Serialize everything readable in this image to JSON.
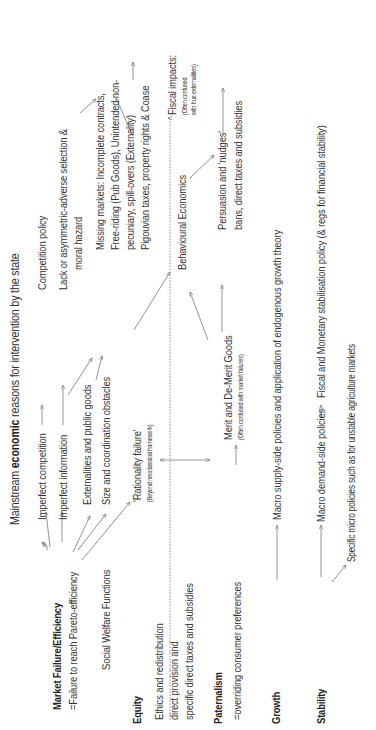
{
  "title": {
    "prefix": "Mainstream ",
    "bold": "economic",
    "suffix": " reasons for intervention by the state"
  },
  "categories": {
    "market_failure": {
      "label": "Market Failure/Efficiency",
      "subtitle": "=Failure to reach Pareto-efficiency"
    },
    "social_welfare": "Social Welfare Functions",
    "equity": {
      "label": "Equity",
      "lines": [
        "Ethics and redistribution",
        "direct provision and",
        "specific direct taxes and subsidies"
      ]
    },
    "paternalism": {
      "label": "Paternalism",
      "subtitle": "=overriding consumer preferences"
    },
    "growth": {
      "label": "Growth",
      "policy": "Macro supply-side policies and application of endogenous growth theory"
    },
    "stability": {
      "label": "Stability",
      "policy_demand": "Macro demand-side policies",
      "policy_fiscal": "Fiscal and Monetary stabilisation policy (& regs for financial stability)",
      "policy_micro": "Specific micro policies such as for unstable agriculture markets"
    }
  },
  "market_failures": [
    "Imperfect competition",
    "Imperfect information",
    "Externalities and public goods",
    "Size and coordination obstacles"
  ],
  "rationality": {
    "label": "'Rationality failure'",
    "note": "(Beyond neoclassical framework)"
  },
  "merit": {
    "label": "Merit and De-Merit Goods",
    "note": "(Often confused with market failures)"
  },
  "remedies": {
    "competition": "Competition policy",
    "information": [
      "Lack or asymmetric-adverse selection &",
      "moral hazard"
    ],
    "missing_markets": [
      "Missing markets: Incomplete contracts,",
      "Free-riding (Pub Goods), Unintended non-",
      "pecuniary, spill-overs (Externality)",
      "Pigouvian taxes, property rights & Coase"
    ],
    "behavioural": "Behavioural Economics",
    "persuasion": [
      "Persuasion and 'nudges'",
      "bans, direct taxes and subsidies"
    ],
    "fiscal": {
      "label": "Fiscal impacts:",
      "note": [
        "(Often confused",
        "with true externalities)"
      ]
    }
  },
  "colors": {
    "text": "#333333",
    "lines": "#777777",
    "background": "#ffffff"
  }
}
